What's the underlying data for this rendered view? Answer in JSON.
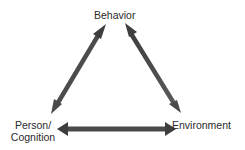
{
  "diagram": {
    "type": "triangle-reciprocal-relationship",
    "nodes": {
      "behavior": {
        "label": "Behavior"
      },
      "person": {
        "line1": "Person/",
        "line2": "Cognition"
      },
      "environment": {
        "label": "Environment"
      }
    },
    "edges": [
      {
        "from": "Behavior",
        "to": "Person/Cognition",
        "direction": "bidirectional"
      },
      {
        "from": "Behavior",
        "to": "Environment",
        "direction": "bidirectional"
      },
      {
        "from": "Person/Cognition",
        "to": "Environment",
        "direction": "bidirectional"
      }
    ],
    "colors": {
      "arrow": "#4a4a4a",
      "text": "#2a2a2a",
      "background": "#ffffff"
    }
  }
}
